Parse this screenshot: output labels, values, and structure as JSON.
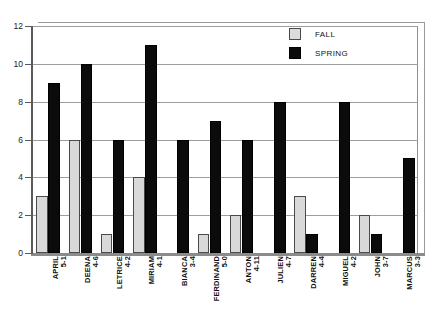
{
  "chart_data": {
    "type": "bar",
    "title": "",
    "xlabel": "",
    "ylabel": "",
    "ylim": [
      0,
      12
    ],
    "yticks": [
      0,
      2,
      4,
      6,
      8,
      10,
      12
    ],
    "grid": true,
    "legend_position": "top-right",
    "categories": [
      "APRIL\n5-1",
      "DEENA\n4-6",
      "LETRICE\n4-2",
      "MIRIAM\n4-1",
      "BIANCA\n3-4",
      "FERDINAND\n5-0",
      "ANTON\n4-11",
      "JULIEN\n4-7",
      "DARREN\n4-4",
      "MIGUEL\n4-2",
      "JOHN\n3-7",
      "MARCUS\n3-3"
    ],
    "category_names": [
      "APRIL",
      "DEENA",
      "LETRICE",
      "MIRIAM",
      "BIANCA",
      "FERDINAND",
      "ANTON",
      "JULIEN",
      "DARREN",
      "MIGUEL",
      "JOHN",
      "MARCUS"
    ],
    "category_ages": [
      "5-1",
      "4-6",
      "4-2",
      "4-1",
      "3-4",
      "5-0",
      "4-11",
      "4-7",
      "4-4",
      "4-2",
      "3-7",
      "3-3"
    ],
    "series": [
      {
        "name": "FALL",
        "color": "#d9d9d9",
        "values": [
          3,
          6,
          1,
          4,
          0,
          1,
          2,
          0,
          3,
          0,
          2,
          0
        ]
      },
      {
        "name": "SPRING",
        "color": "#0b0b0b",
        "values": [
          9,
          10,
          6,
          11,
          6,
          7,
          6,
          8,
          1,
          8,
          1,
          5
        ]
      }
    ]
  },
  "legend": {
    "items": [
      {
        "label": "FALL",
        "swatch": "fall-swatch"
      },
      {
        "label": "SPRING",
        "swatch": "spring-swatch"
      }
    ]
  }
}
